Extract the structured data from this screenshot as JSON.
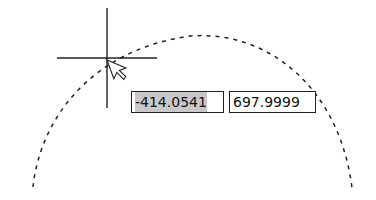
{
  "canvas": {
    "background": "#ffffff",
    "line_color": "#222222"
  },
  "crosshair": {
    "center": [
      107,
      58
    ],
    "arm_length": 50
  },
  "arc": {
    "style": "dashed",
    "start": [
      33,
      187
    ],
    "peak": [
      190,
      35
    ],
    "end": [
      352,
      188
    ]
  },
  "dynamic_input": {
    "x_value": "-414.0541",
    "y_value": "697.9999",
    "x_selected": true
  },
  "cursor": {
    "icon": "arrow-pointer-icon",
    "position": [
      107,
      60
    ]
  }
}
